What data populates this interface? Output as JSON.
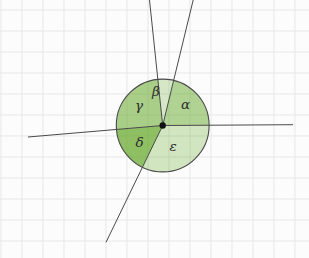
{
  "canvas": {
    "width": 309,
    "height": 258,
    "background": "#fcfcfc"
  },
  "grid": {
    "spacing": 21,
    "offset_x": 1,
    "offset_y": 10,
    "color": "#e7e7e7"
  },
  "figure": {
    "center": {
      "x": 162.7,
      "y": 125.5
    },
    "radius": 46.4,
    "point_color": "#111111",
    "point_radius": 3.2,
    "stroke_color": "#4a4a4a",
    "sector_base_color": "#64a828",
    "label_color": "#2b2b2b",
    "label_font_size": 13.5,
    "rays": [
      {
        "name": "ray-right",
        "x2": 293,
        "y2": 124.7
      },
      {
        "name": "ray-up-right",
        "x2": 193.2,
        "y2": 0
      },
      {
        "name": "ray-up",
        "x2": 149.5,
        "y2": 0
      },
      {
        "name": "ray-left",
        "x2": 28,
        "y2": 137
      },
      {
        "name": "ray-down-left",
        "x2": 106,
        "y2": 242.3
      }
    ],
    "sectors": [
      {
        "name": "alpha",
        "label": "α",
        "start_deg": 0.35,
        "end_deg": 76.3,
        "opacity": 0.5,
        "label_x": 185.5,
        "label_y": 104
      },
      {
        "name": "beta",
        "label": "β",
        "start_deg": 76.3,
        "end_deg": 96.0,
        "opacity": 0.25,
        "label_x": 156,
        "label_y": 90.5
      },
      {
        "name": "gamma",
        "label": "γ",
        "start_deg": 96.0,
        "end_deg": 184.9,
        "opacity": 0.55,
        "label_x": 139,
        "label_y": 104.5
      },
      {
        "name": "delta",
        "label": "δ",
        "start_deg": 184.9,
        "end_deg": 244.1,
        "opacity": 0.72,
        "label_x": 139.5,
        "label_y": 142
      },
      {
        "name": "epsilon",
        "label": "ε",
        "start_deg": 244.1,
        "end_deg": 360.35,
        "opacity": 0.28,
        "label_x": 173,
        "label_y": 146
      }
    ]
  }
}
